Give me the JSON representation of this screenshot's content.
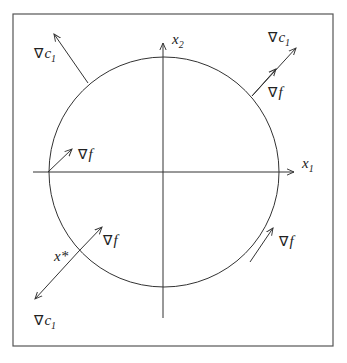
{
  "diagram": {
    "frame": {
      "x": 13,
      "y": 14,
      "width": 320,
      "height": 332
    },
    "circle": {
      "cx": 164,
      "cy": 172,
      "r": 115
    },
    "axes": {
      "x1": {
        "label": "x",
        "subscript": "1",
        "from": [
          33,
          172
        ],
        "to": [
          294,
          172
        ]
      },
      "x2": {
        "label": "x",
        "subscript": "2",
        "from": [
          163,
          318
        ],
        "to": [
          163,
          43
        ]
      }
    },
    "vectors": [
      {
        "id": "top-left-grad-c1",
        "name": "∇",
        "symbol": "c",
        "subscript": "1",
        "from": [
          88,
          83
        ],
        "to": [
          54,
          34
        ],
        "label_pos": [
          34,
          58
        ]
      },
      {
        "id": "top-right-grad-f",
        "name": "∇",
        "symbol": "f",
        "subscript": "",
        "from": [
          252,
          96
        ],
        "to": [
          276,
          69
        ],
        "label_pos": [
          268,
          97
        ]
      },
      {
        "id": "top-right-grad-c1",
        "name": "∇",
        "symbol": "c",
        "subscript": "1",
        "from": [
          252,
          96
        ],
        "to": [
          296,
          48
        ],
        "label_pos": [
          268,
          42
        ]
      },
      {
        "id": "left-grad-f",
        "name": "∇",
        "symbol": "f",
        "subscript": "",
        "from": [
          48,
          172
        ],
        "to": [
          72,
          149
        ],
        "label_pos": [
          78,
          159
        ]
      },
      {
        "id": "bottom-left-grad-f",
        "name": "∇",
        "symbol": "f",
        "subscript": "",
        "from": [
          79,
          251
        ],
        "to": [
          102,
          227
        ],
        "label_pos": [
          103,
          245
        ]
      },
      {
        "id": "bottom-left-grad-c1",
        "name": "∇",
        "symbol": "c",
        "subscript": "1",
        "from": [
          79,
          251
        ],
        "to": [
          35,
          299
        ],
        "label_pos": [
          34,
          325
        ]
      },
      {
        "id": "bottom-right-grad-f",
        "name": "∇",
        "symbol": "f",
        "subscript": "",
        "from": [
          250,
          262
        ],
        "to": [
          273,
          228
        ],
        "label_pos": [
          279,
          246
        ]
      }
    ],
    "point_label": {
      "text": "x*",
      "x": 54,
      "y": 261
    },
    "colors": {
      "stroke": "#333333",
      "text": "#222222",
      "background": "#ffffff"
    }
  }
}
